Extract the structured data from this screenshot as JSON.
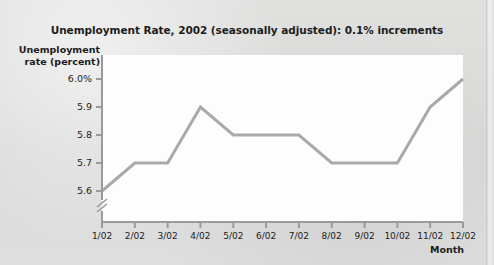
{
  "figure": {
    "title": "Unemployment Rate, 2002 (seasonally adjusted): 0.1% increments",
    "y_axis_title_line1": "Unemployment",
    "y_axis_title_line2": "rate (percent)",
    "x_axis_title": "Month",
    "line_color": "#a9a9a9",
    "axis_color": "#9a9a9a",
    "plot_background": "#fdfdfd",
    "page_background": "#dcdcdb",
    "text_color": "#1c1c1c"
  },
  "chart_data": {
    "type": "line",
    "title": "Unemployment Rate, 2002 (seasonally adjusted): 0.1% increments",
    "xlabel": "Month",
    "ylabel": "Unemployment rate (percent)",
    "categories": [
      "1/02",
      "2/02",
      "3/02",
      "4/02",
      "5/02",
      "6/02",
      "7/02",
      "8/02",
      "9/02",
      "10/02",
      "11/02",
      "12/02"
    ],
    "values": [
      5.6,
      5.7,
      5.7,
      5.9,
      5.8,
      5.8,
      5.8,
      5.7,
      5.7,
      5.7,
      5.9,
      6.0
    ],
    "ytick_labels": [
      "6.0%",
      "5.9",
      "5.8",
      "5.7",
      "5.6"
    ],
    "ytick_values": [
      6.0,
      5.9,
      5.8,
      5.7,
      5.6
    ],
    "ylim": [
      5.6,
      6.0
    ],
    "y_increment": 0.1,
    "y_axis_break": true,
    "grid": false,
    "legend": false,
    "series": [
      {
        "name": "Unemployment rate",
        "values": [
          5.6,
          5.7,
          5.7,
          5.9,
          5.8,
          5.8,
          5.8,
          5.7,
          5.7,
          5.7,
          5.9,
          6.0
        ]
      }
    ]
  }
}
